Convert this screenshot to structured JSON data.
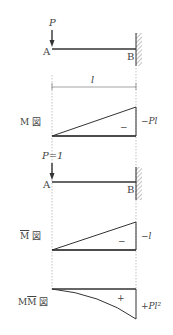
{
  "diagram": {
    "beam1": {
      "load_label": "P",
      "left_label": "A",
      "right_label": "B"
    },
    "dimension": {
      "label": "l"
    },
    "m_diagram": {
      "title_main": "M",
      "title_suffix": "図",
      "sign": "−",
      "end_value": "−Pl"
    },
    "beam2": {
      "load_label": "P=1",
      "left_label": "A",
      "right_label": "B"
    },
    "mbar_diagram": {
      "title_main": "M",
      "title_suffix": "図",
      "sign": "−",
      "end_value": "−l"
    },
    "mmbar_diagram": {
      "title_m": "M",
      "title_mbar": "M",
      "title_suffix": "図",
      "sign": "+",
      "end_value": "+Pl²"
    }
  }
}
